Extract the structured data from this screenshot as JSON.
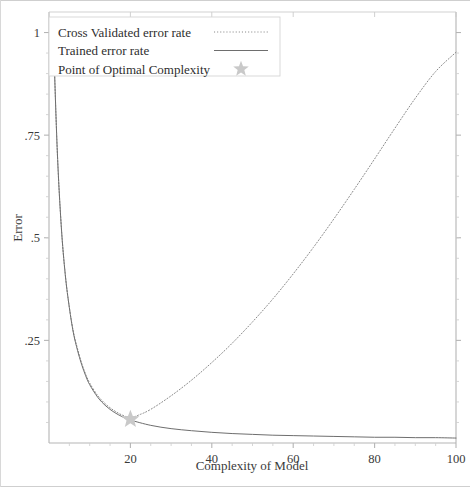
{
  "chart_data": {
    "type": "line",
    "title": "",
    "xlabel": "Complexity of Model",
    "ylabel": "Error",
    "xlim": [
      0,
      100
    ],
    "ylim": [
      0,
      1.05
    ],
    "xticks": [
      20,
      40,
      60,
      80,
      100
    ],
    "xtick_labels": [
      "20",
      "40",
      "60",
      "80",
      "100"
    ],
    "yticks": [
      0.25,
      0.5,
      0.75,
      1
    ],
    "ytick_labels": [
      ".25",
      ".5",
      ".75",
      "1"
    ],
    "grid": false,
    "minor_ticks": true,
    "legend_position": "top-left",
    "series": [
      {
        "name": "Cross Validated error rate",
        "style": "dotted",
        "color": "#8a8a8a",
        "x": [
          1,
          2,
          3,
          4,
          5,
          6,
          7,
          8,
          9,
          10,
          12,
          14,
          16,
          18,
          20,
          22,
          25,
          30,
          35,
          40,
          45,
          50,
          55,
          60,
          65,
          70,
          75,
          80,
          85,
          90,
          95,
          100
        ],
        "y": [
          1.02,
          0.72,
          0.53,
          0.41,
          0.33,
          0.27,
          0.23,
          0.195,
          0.168,
          0.146,
          0.115,
          0.094,
          0.079,
          0.068,
          0.062,
          0.068,
          0.082,
          0.115,
          0.153,
          0.196,
          0.243,
          0.295,
          0.351,
          0.412,
          0.477,
          0.546,
          0.618,
          0.692,
          0.767,
          0.84,
          0.905,
          0.952
        ]
      },
      {
        "name": "Trained error rate",
        "style": "solid",
        "color": "#6e6e6e",
        "x": [
          1,
          2,
          3,
          4,
          5,
          6,
          7,
          8,
          9,
          10,
          12,
          14,
          16,
          18,
          20,
          25,
          30,
          35,
          40,
          45,
          50,
          55,
          60,
          65,
          70,
          75,
          80,
          85,
          90,
          95,
          100
        ],
        "y": [
          1.02,
          0.72,
          0.53,
          0.41,
          0.33,
          0.268,
          0.226,
          0.192,
          0.164,
          0.142,
          0.111,
          0.09,
          0.075,
          0.064,
          0.056,
          0.043,
          0.035,
          0.03,
          0.026,
          0.023,
          0.021,
          0.019,
          0.018,
          0.017,
          0.016,
          0.015,
          0.014,
          0.014,
          0.013,
          0.013,
          0.012
        ]
      }
    ],
    "annotations": [
      {
        "name": "Point of Optimal Complexity",
        "marker": "star",
        "color": "#c9c9c9",
        "x": 20,
        "y": 0.058
      }
    ]
  },
  "legend": {
    "items": [
      {
        "label": "Cross Validated error rate",
        "marker": "dotted-line"
      },
      {
        "label": "Trained error rate",
        "marker": "solid-line"
      },
      {
        "label": "Point of Optimal Complexity",
        "marker": "star"
      }
    ]
  },
  "colors": {
    "axis": "#b5b5b5",
    "cv_curve": "#8a8a8a",
    "trained_curve": "#6e6e6e",
    "star": "#c9c9c9",
    "text": "#2e2e2e",
    "legend_border": "#d5d5d5",
    "background": "#ffffff"
  }
}
